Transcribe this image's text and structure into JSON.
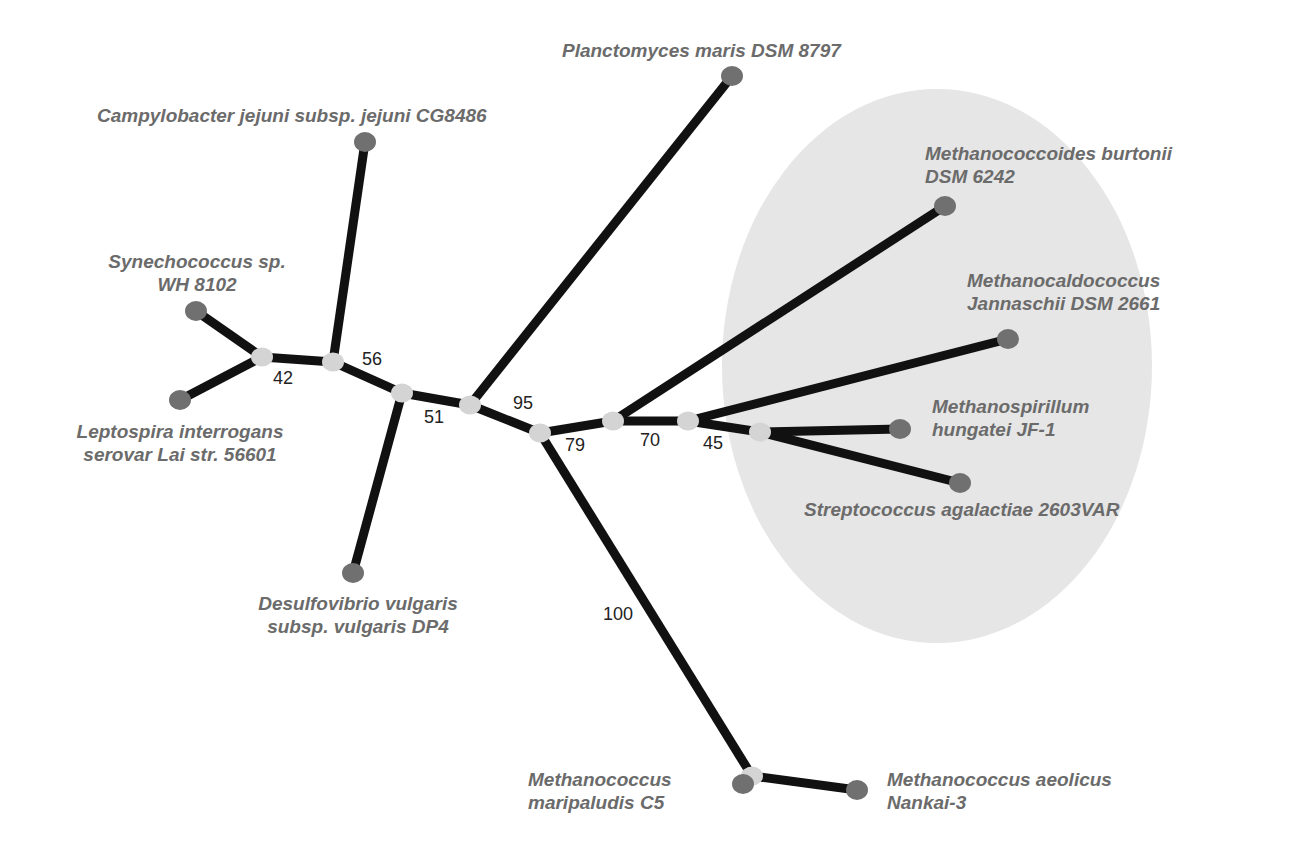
{
  "diagram": {
    "type": "unrooted phylogenetic tree",
    "colors": {
      "branch": "#111111",
      "leaf_node": "#707070",
      "internal_node": "#d4d4d4",
      "highlight_ellipse": "#e6e6e6",
      "taxon_text": "#6b6b6b",
      "support_text": "#222222"
    },
    "highlight_region": {
      "cx": 937,
      "cy": 366,
      "rx": 215,
      "ry": 277
    },
    "internal_nodes": [
      {
        "id": "n42",
        "x": 262,
        "y": 357
      },
      {
        "id": "n56",
        "x": 333,
        "y": 362
      },
      {
        "id": "n51",
        "x": 402,
        "y": 393
      },
      {
        "id": "n95",
        "x": 470,
        "y": 405
      },
      {
        "id": "n79",
        "x": 540,
        "y": 433
      },
      {
        "id": "n70",
        "x": 613,
        "y": 421
      },
      {
        "id": "n45",
        "x": 688,
        "y": 421
      },
      {
        "id": "nArc",
        "x": 760,
        "y": 432
      },
      {
        "id": "n100",
        "x": 752,
        "y": 776
      }
    ],
    "leaves": [
      {
        "id": "synechococcus",
        "x": 196,
        "y": 311
      },
      {
        "id": "leptospira",
        "x": 180,
        "y": 400
      },
      {
        "id": "campylobacter",
        "x": 365,
        "y": 142
      },
      {
        "id": "desulfovibrio",
        "x": 353,
        "y": 573
      },
      {
        "id": "planctomyces",
        "x": 732,
        "y": 76
      },
      {
        "id": "methanococcoides",
        "x": 945,
        "y": 206
      },
      {
        "id": "methanocaldococcus",
        "x": 1008,
        "y": 339
      },
      {
        "id": "methanospirillum",
        "x": 900,
        "y": 429
      },
      {
        "id": "streptococcus",
        "x": 960,
        "y": 483
      },
      {
        "id": "maripaludis",
        "x": 743,
        "y": 784
      },
      {
        "id": "aeolicus",
        "x": 857,
        "y": 790
      }
    ],
    "edges": [
      [
        "synechococcus",
        "n42"
      ],
      [
        "leptospira",
        "n42"
      ],
      [
        "n42",
        "n56"
      ],
      [
        "campylobacter",
        "n56"
      ],
      [
        "n56",
        "n51"
      ],
      [
        "desulfovibrio",
        "n51"
      ],
      [
        "n51",
        "n95"
      ],
      [
        "planctomyces",
        "n95"
      ],
      [
        "n95",
        "n79"
      ],
      [
        "n79",
        "n100"
      ],
      [
        "n100",
        "maripaludis"
      ],
      [
        "n100",
        "aeolicus"
      ],
      [
        "n79",
        "n70"
      ],
      [
        "n70",
        "methanococcoides"
      ],
      [
        "n70",
        "n45"
      ],
      [
        "n45",
        "methanocaldococcus"
      ],
      [
        "n45",
        "nArc"
      ],
      [
        "nArc",
        "methanospirillum"
      ],
      [
        "nArc",
        "streptococcus"
      ]
    ]
  },
  "taxa": {
    "synechococcus": {
      "line1": "Synechococcus sp.",
      "line2": "WH 8102"
    },
    "leptospira": {
      "line1": "Leptospira interrogans",
      "line2": "serovar Lai str. 56601"
    },
    "campylobacter": {
      "line1": "Campylobacter jejuni subsp. jejuni CG8486"
    },
    "desulfovibrio": {
      "line1": "Desulfovibrio vulgaris",
      "line2": "subsp. vulgaris DP4"
    },
    "planctomyces": {
      "line1": "Planctomyces maris DSM 8797"
    },
    "methanococcoides": {
      "line1": "Methanococcoides burtonii",
      "line2": "DSM 6242"
    },
    "methanocaldococcus": {
      "line1": "Methanocaldococcus",
      "line2": "Jannaschii DSM 2661"
    },
    "methanospirillum": {
      "line1": "Methanospirillum",
      "line2": "hungatei JF-1"
    },
    "streptococcus": {
      "line1": "Streptococcus agalactiae 2603VAR"
    },
    "maripaludis": {
      "line1": "Methanococcus",
      "line2": "maripaludis C5"
    },
    "aeolicus": {
      "line1": "Methanococcus aeolicus",
      "line2": "Nankai-3"
    }
  },
  "support_values": {
    "n42": "42",
    "n56": "56",
    "n51": "51",
    "n95": "95",
    "n79": "79",
    "n70": "70",
    "n45": "45",
    "n100": "100"
  }
}
